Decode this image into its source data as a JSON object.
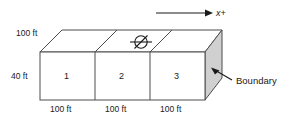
{
  "figure": {
    "type": "engineering-diagram",
    "axis": {
      "label": "x+",
      "icon": "right-arrow-icon"
    },
    "dimensions": {
      "depth_top": "100 ft",
      "height_left": "40 ft",
      "bottom": [
        "100 ft",
        "100 ft",
        "100 ft"
      ]
    },
    "cells": [
      {
        "label": "1"
      },
      {
        "label": "2"
      },
      {
        "label": "3"
      }
    ],
    "well": {
      "icon": "well-symbol-icon",
      "cell": "2"
    },
    "boundary": {
      "label": "Boundary",
      "icon": "pointer-arrow-icon"
    },
    "colors": {
      "outline": "#4d4d4d",
      "shaded_face": "#d0d0d0",
      "face_fill": "#ffffff",
      "text": "#1a1a1a"
    }
  }
}
